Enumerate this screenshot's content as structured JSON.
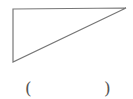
{
  "figure": {
    "shape": "right-triangle",
    "stroke_color": "#777777",
    "stroke_width": 1.2,
    "vertices": [
      [
        13,
        9
      ],
      [
        126,
        8
      ],
      [
        13,
        62
      ]
    ]
  },
  "answer": {
    "open_paren": "(",
    "close_paren": ")",
    "value": ""
  }
}
